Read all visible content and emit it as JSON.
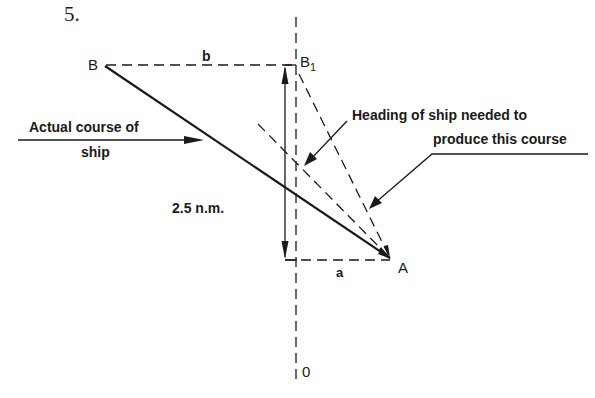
{
  "figure": {
    "number": "5.",
    "points": {
      "B": "B",
      "B1_main": "B",
      "B1_sub": "1",
      "A": "A",
      "O": "0"
    },
    "segment_labels": {
      "b": "b",
      "a": "a"
    },
    "distance_label": "2.5 n.m.",
    "annotations": {
      "actual_course_line1": "Actual course of",
      "actual_course_line2": "ship",
      "heading_line1": "Heading of ship needed to",
      "heading_line2": "produce this course"
    },
    "colors": {
      "ink": "#1a1a1a",
      "background": "#ffffff"
    }
  }
}
